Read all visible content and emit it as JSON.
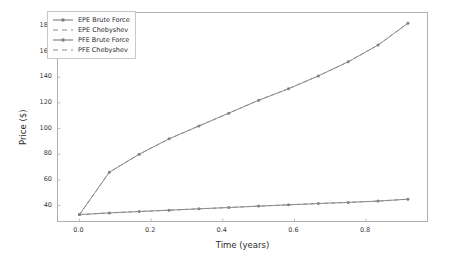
{
  "chart_data": {
    "type": "line",
    "title": "",
    "xlabel": "Time (years)",
    "ylabel": "Price ($)",
    "xlim": [
      -0.06,
      0.97
    ],
    "ylim": [
      28,
      190
    ],
    "grid": false,
    "legend_position": "upper left",
    "xticks": [
      "0.0",
      "0.2",
      "0.4",
      "0.6",
      "0.8"
    ],
    "xtick_values": [
      0.0,
      0.2,
      0.4,
      0.6,
      0.8
    ],
    "yticks": [
      "40",
      "60",
      "80",
      "100",
      "120",
      "140",
      "160",
      "180"
    ],
    "ytick_values": [
      40,
      60,
      80,
      100,
      120,
      140,
      160,
      180
    ],
    "x": [
      0.0,
      0.0833,
      0.1667,
      0.25,
      0.3333,
      0.4167,
      0.5,
      0.5833,
      0.6667,
      0.75,
      0.8333,
      0.9167
    ],
    "series": [
      {
        "name": "EPE Brute Force",
        "style": "solid-marker",
        "color": "#7f7f7f",
        "values": [
          33.0,
          66.0,
          80.0,
          92.0,
          102.0,
          112.0,
          122.0,
          131.0,
          141.0,
          152.0,
          165.0,
          182.0
        ]
      },
      {
        "name": "EPE Chebyshev",
        "style": "dashed",
        "color": "#8c8c8c",
        "values": [
          33.0,
          66.0,
          80.0,
          92.0,
          102.0,
          112.0,
          122.0,
          131.0,
          141.0,
          152.0,
          165.0,
          182.0
        ]
      },
      {
        "name": "PFE Brute Force",
        "style": "solid-marker",
        "color": "#7f7f7f",
        "values": [
          33.0,
          34.3,
          35.4,
          36.4,
          37.5,
          38.5,
          39.6,
          40.6,
          41.6,
          42.5,
          43.5,
          45.0
        ]
      },
      {
        "name": "PFE Chebyshev",
        "style": "dashed",
        "color": "#8c8c8c",
        "values": [
          33.0,
          34.3,
          35.4,
          36.4,
          37.5,
          38.5,
          39.6,
          40.6,
          41.6,
          42.5,
          43.5,
          45.0
        ]
      }
    ]
  },
  "legend": {
    "entries": [
      {
        "label": "EPE Brute Force"
      },
      {
        "label": "EPE Chebyshev"
      },
      {
        "label": "PFE Brute Force"
      },
      {
        "label": "PFE Chebyshev"
      }
    ]
  }
}
